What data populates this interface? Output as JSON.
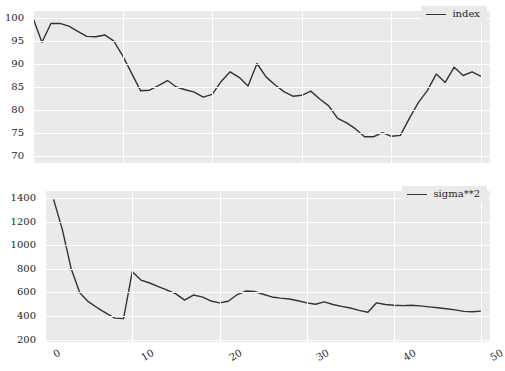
{
  "figure": {
    "background_color": "#ffffff",
    "plot_background_color": "#eaeaea",
    "grid_color": "#ffffff",
    "line_color": "#333333",
    "text_color": "#262626"
  },
  "chart_data": [
    {
      "type": "line",
      "id": "index-chart",
      "title": "",
      "xlabel": "",
      "ylabel": "",
      "xlim": [
        0,
        51
      ],
      "ylim": [
        68.5,
        101.5
      ],
      "yticks": [
        70,
        75,
        80,
        85,
        90,
        95,
        100
      ],
      "xticks": [
        0,
        10,
        20,
        30,
        40,
        50
      ],
      "xtick_labels_visible": false,
      "grid": true,
      "legend": {
        "position": "upper-right",
        "entries": [
          "index"
        ]
      },
      "series": [
        {
          "name": "index",
          "color": "#333333",
          "x": [
            0,
            1,
            2,
            3,
            4,
            5,
            6,
            7,
            8,
            9,
            10,
            11,
            12,
            13,
            14,
            15,
            16,
            17,
            18,
            19,
            20,
            21,
            22,
            23,
            24,
            25,
            26,
            27,
            28,
            29,
            30,
            31,
            32,
            33,
            34,
            35,
            36,
            37,
            38,
            39,
            40,
            41,
            42,
            43,
            44,
            45,
            46,
            47,
            48,
            49,
            50
          ],
          "values": [
            100.0,
            94.7,
            98.8,
            98.8,
            98.2,
            97.1,
            96.0,
            95.9,
            96.3,
            95.0,
            91.8,
            88.0,
            84.2,
            84.3,
            85.3,
            86.4,
            85.0,
            84.4,
            83.9,
            82.8,
            83.4,
            86.2,
            88.3,
            87.1,
            85.2,
            90.1,
            87.2,
            85.5,
            84.0,
            83.0,
            83.2,
            84.1,
            82.4,
            80.9,
            78.2,
            77.2,
            75.9,
            74.2,
            74.2,
            75.1,
            74.3,
            74.5,
            78.2,
            81.6,
            84.2,
            87.8,
            86.0,
            89.3,
            87.5,
            88.3,
            87.3
          ]
        }
      ]
    },
    {
      "type": "line",
      "id": "sigma-squared-chart",
      "title": "",
      "xlabel": "",
      "ylabel": "",
      "xlim": [
        0,
        51
      ],
      "ylim": [
        180,
        1460
      ],
      "yticks": [
        200,
        400,
        600,
        800,
        1000,
        1200,
        1400
      ],
      "xticks": [
        0,
        10,
        20,
        30,
        40,
        50
      ],
      "xtick_labels": [
        "0",
        "10",
        "20",
        "30",
        "40",
        "50"
      ],
      "xtick_labels_visible": true,
      "grid": true,
      "legend": {
        "position": "upper-right",
        "entries": [
          "sigma**2"
        ]
      },
      "series": [
        {
          "name": "sigma**2",
          "color": "#333333",
          "x": [
            1,
            2,
            3,
            4,
            5,
            6,
            7,
            8,
            9,
            10,
            11,
            12,
            13,
            14,
            15,
            16,
            17,
            18,
            19,
            20,
            21,
            22,
            23,
            24,
            25,
            26,
            27,
            28,
            29,
            30,
            31,
            32,
            33,
            34,
            35,
            36,
            37,
            38,
            39,
            40,
            41,
            42,
            43,
            44,
            45,
            46,
            47,
            48,
            49,
            50
          ],
          "values": [
            1385,
            1130,
            800,
            595,
            520,
            470,
            425,
            382,
            378,
            775,
            705,
            680,
            650,
            620,
            588,
            535,
            578,
            562,
            528,
            512,
            525,
            580,
            612,
            608,
            585,
            562,
            552,
            545,
            530,
            512,
            500,
            520,
            498,
            482,
            468,
            448,
            432,
            512,
            498,
            492,
            488,
            492,
            486,
            478,
            470,
            462,
            452,
            440,
            436,
            442
          ]
        }
      ]
    }
  ]
}
